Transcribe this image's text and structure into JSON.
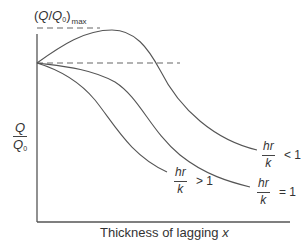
{
  "diagram": {
    "type": "line-sketch",
    "title": "",
    "y_axis": {
      "label_numerator": "Q",
      "label_denominator_base": "Q",
      "label_denominator_sub": "0"
    },
    "x_axis": {
      "label_text": "Thickness of lagging ",
      "label_var": "x"
    },
    "max_marker": {
      "open": "(",
      "q": "Q",
      "slash": "/",
      "q0": "Q",
      "q0_sub": "0",
      "close": ")",
      "sub": "max"
    },
    "reference_lines": [
      {
        "name": "max-level",
        "style": "dashed"
      },
      {
        "name": "unit-level",
        "style": "dashed"
      }
    ],
    "curves": [
      {
        "name": "hr-over-k-less-than-1",
        "numerator": "hr",
        "denominator": "k",
        "relation": "< 1"
      },
      {
        "name": "hr-over-k-equal-1",
        "numerator": "hr",
        "denominator": "k",
        "relation": "= 1"
      },
      {
        "name": "hr-over-k-greater-than-1",
        "numerator": "hr",
        "denominator": "k",
        "relation": "> 1"
      }
    ],
    "colors": {
      "line": "#555555",
      "text": "#333333",
      "background": "#ffffff"
    }
  }
}
